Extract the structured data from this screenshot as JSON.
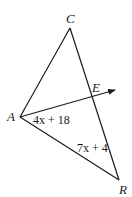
{
  "diagram": {
    "type": "triangle-with-angle-bisector-ray",
    "vertices": {
      "C": {
        "label": "C",
        "x": 70,
        "y": 28
      },
      "A": {
        "label": "A",
        "x": 20,
        "y": 117
      },
      "R": {
        "label": "R",
        "x": 119,
        "y": 180
      },
      "E": {
        "label": "E",
        "x": 92,
        "y": 96
      }
    },
    "ray": {
      "from": "A",
      "through": "E",
      "arrow": true
    },
    "angle_labels": {
      "angle_EAR": "4x + 18",
      "angle_ARC": "7x + 4"
    },
    "colors": {
      "stroke": "#1a1a1a",
      "background": "#ffffff"
    }
  }
}
